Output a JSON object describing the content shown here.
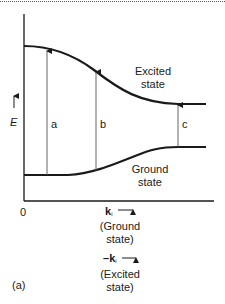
{
  "figure": {
    "panel_label": "(a)",
    "y_axis_label": "E",
    "origin_label": "0",
    "curves": {
      "excited": {
        "label_line1": "Excited",
        "label_line2": "state"
      },
      "ground": {
        "label_line1": "Ground",
        "label_line2": "state"
      }
    },
    "transitions": [
      {
        "label": "a"
      },
      {
        "label": "b"
      },
      {
        "label": "c"
      }
    ],
    "x_axis": {
      "ground": {
        "symbol": "k",
        "subscript": "i",
        "line1": "(Ground",
        "line2": "state)"
      },
      "excited": {
        "prefix": "–",
        "symbol": "k",
        "subscript": "i",
        "line1": "(Excited",
        "line2": "state)"
      }
    },
    "colors": {
      "line": "#1a1a1a",
      "arrow": "#555555"
    }
  }
}
